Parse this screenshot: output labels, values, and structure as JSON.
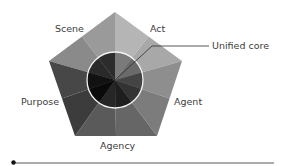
{
  "diagram": {
    "type": "pentad",
    "labels": {
      "scene": "Scene",
      "act": "Act",
      "agent": "Agent",
      "agency": "Agency",
      "purpose": "Purpose"
    },
    "callout": "Unified core",
    "colors": {
      "scene_outer_a": "#8f8f8f",
      "scene_outer_b": "#979797",
      "act_outer_a": "#b3b3b3",
      "act_outer_b": "#a6a6a6",
      "agent_outer_a": "#8c8c8c",
      "agent_outer_b": "#747474",
      "agency_outer_a": "#5d5d5d",
      "agency_outer_b": "#666666",
      "purpose_outer_a": "#3e3e3e",
      "purpose_outer_b": "#4a4a4a",
      "circle_stroke": "#f2f2f2",
      "rule": "#5a5a5a"
    }
  }
}
